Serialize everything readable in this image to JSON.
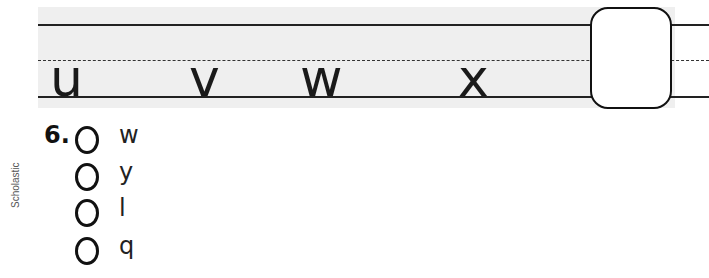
{
  "sequence": {
    "letters": [
      "u",
      "v",
      "w",
      "x"
    ],
    "answer_box": ""
  },
  "question": {
    "number": "6.",
    "options": [
      {
        "label": "w"
      },
      {
        "label": "y"
      },
      {
        "label": "l"
      },
      {
        "label": "q"
      }
    ]
  },
  "credit": "Scholastic"
}
